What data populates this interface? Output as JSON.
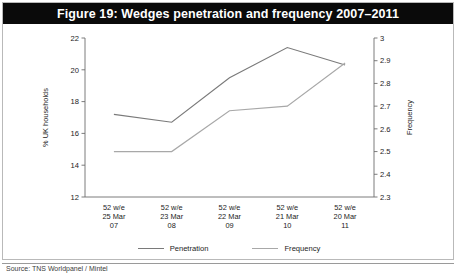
{
  "figure": {
    "title": "Figure 19: Wedges penetration and frequency 2007–2011",
    "footer_note": "Source: TNS Worldpanel / Mintel"
  },
  "legend": {
    "position": "bottom-center",
    "entries": [
      {
        "label": "Penetration",
        "color": "#7a7a7a"
      },
      {
        "label": "Frequency",
        "color": "#a8a8a8"
      }
    ]
  },
  "colors": {
    "title_bar": "#0a0a0a",
    "title_text": "#ffffff",
    "frame_border": "#b9b9b9",
    "axis": "#6e6e6e",
    "penetration_line": "#7a7a7a",
    "frequency_line": "#a8a8a8",
    "background": "#ffffff"
  },
  "chart_data": {
    "type": "line",
    "title": "Figure 19: Wedges penetration and frequency 2007–2011",
    "xlabel": "",
    "ylabel": "% UK households",
    "y2label": "Frequency",
    "grid": false,
    "legend_position": "bottom-center",
    "categories": [
      "52 w/e 25 Mar 07",
      "52 w/e 23 Mar 08",
      "52 w/e 22 Mar 09",
      "52 w/e 21 Mar 10",
      "52 w/e 20 Mar 11"
    ],
    "category_lines": [
      [
        "52 w/e",
        "25 Mar",
        "07"
      ],
      [
        "52 w/e",
        "23 Mar",
        "08"
      ],
      [
        "52 w/e",
        "22 Mar",
        "09"
      ],
      [
        "52 w/e",
        "21 Mar",
        "10"
      ],
      [
        "52 w/e",
        "20 Mar",
        "11"
      ]
    ],
    "ylim": [
      12,
      22
    ],
    "yticks": [
      12,
      14,
      16,
      18,
      20,
      22
    ],
    "ytick_labels": [
      "12",
      "14",
      "16",
      "18",
      "20",
      "22"
    ],
    "y2lim": [
      2.3,
      3.0
    ],
    "y2ticks": [
      2.3,
      2.4,
      2.5,
      2.6,
      2.7,
      2.8,
      2.9,
      3.0
    ],
    "y2tick_labels": [
      "2.3",
      "2.4",
      "2.5",
      "2.6",
      "2.7",
      "2.8",
      "2.9",
      "3"
    ],
    "series": [
      {
        "name": "Penetration",
        "axis": "left",
        "unit": "% UK households",
        "values": [
          17.2,
          16.7,
          19.5,
          21.4,
          20.3
        ]
      },
      {
        "name": "Frequency",
        "axis": "right",
        "unit": "times per year",
        "values": [
          2.5,
          2.5,
          2.68,
          2.7,
          2.89
        ]
      }
    ]
  }
}
